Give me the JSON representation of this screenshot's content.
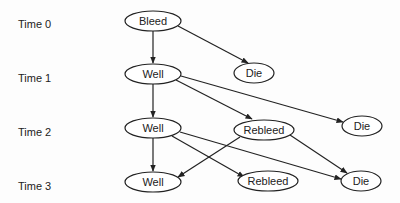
{
  "time_labels": [
    "Time 0",
    "Time 1",
    "Time 2",
    "Time 3"
  ],
  "nodes": {
    "bleed_t0": {
      "label": "Bleed"
    },
    "well_t1": {
      "label": "Well"
    },
    "die_t1": {
      "label": "Die"
    },
    "well_t2": {
      "label": "Well"
    },
    "rebleed_t2": {
      "label": "Rebleed"
    },
    "die_t2": {
      "label": "Die"
    },
    "well_t3": {
      "label": "Well"
    },
    "rebleed_t3": {
      "label": "Rebleed"
    },
    "die_t3": {
      "label": "Die"
    }
  },
  "edges": [
    [
      "bleed_t0",
      "well_t1"
    ],
    [
      "bleed_t0",
      "die_t1"
    ],
    [
      "well_t1",
      "well_t2"
    ],
    [
      "well_t1",
      "rebleed_t2"
    ],
    [
      "well_t1",
      "die_t2"
    ],
    [
      "well_t2",
      "well_t3"
    ],
    [
      "well_t2",
      "rebleed_t3"
    ],
    [
      "well_t2",
      "die_t3"
    ],
    [
      "rebleed_t2",
      "well_t3"
    ],
    [
      "rebleed_t2",
      "die_t3"
    ]
  ]
}
